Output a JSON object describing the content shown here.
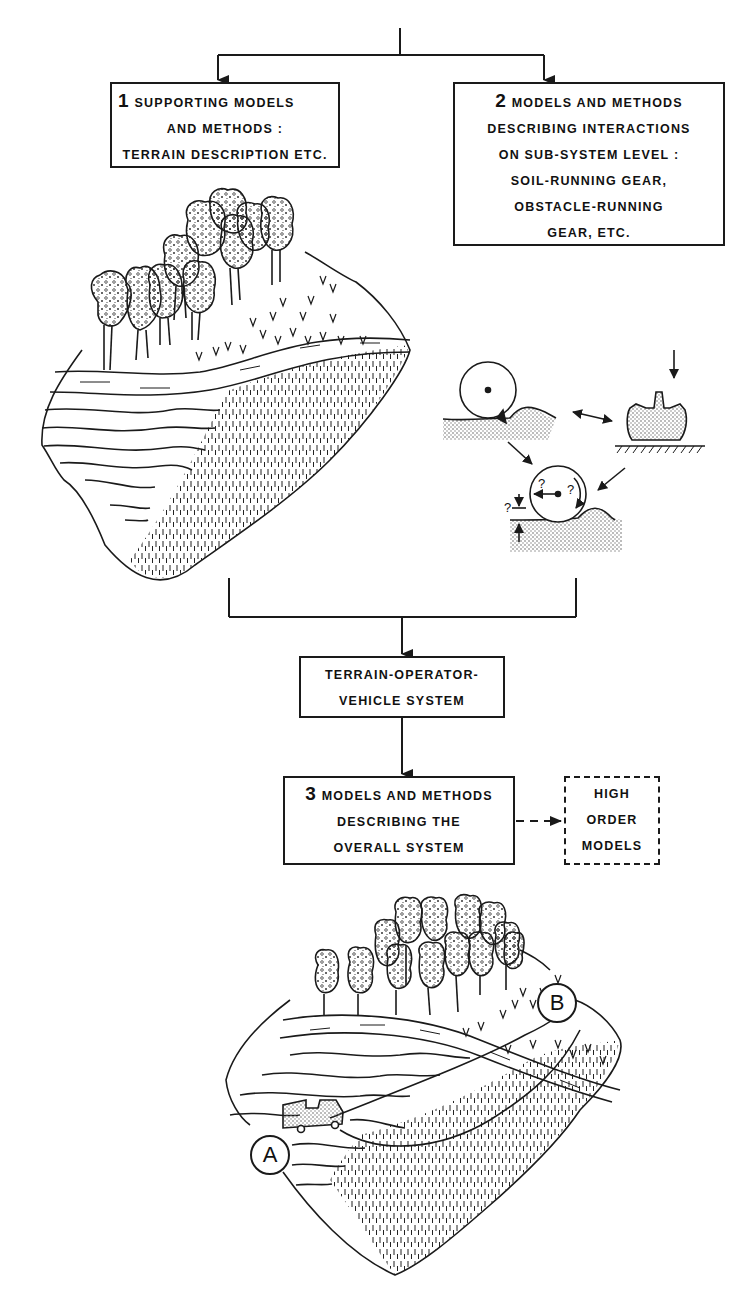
{
  "diagram": {
    "type": "flowchart",
    "boxes": {
      "supporting": {
        "number": "1",
        "lines": [
          "SUPPORTING MODELS",
          "AND METHODS :",
          "TERRAIN DESCRIPTION ETC."
        ]
      },
      "subsystem": {
        "number": "2",
        "lines": [
          "MODELS AND METHODS",
          "DESCRIBING INTERACTIONS",
          "ON SUB-SYSTEM LEVEL :",
          "SOIL-RUNNING GEAR,",
          "OBSTACLE-RUNNING",
          "GEAR, ETC."
        ]
      },
      "system": {
        "lines": [
          "TERRAIN-OPERATOR-",
          "VEHICLE SYSTEM"
        ]
      },
      "overall": {
        "number": "3",
        "lines": [
          "MODELS AND METHODS",
          "DESCRIBING THE",
          "OVERALL SYSTEM"
        ]
      },
      "high_order": {
        "style": "dashed",
        "lines": [
          "HIGH",
          "ORDER",
          "MODELS"
        ]
      }
    },
    "illustrations": {
      "terrain_top": "terrain-block-with-trees-grass-and-soil-layers",
      "wheel_interactions": {
        "question_marks": [
          "?",
          "?",
          "?"
        ]
      },
      "terrain_bottom": {
        "markers": [
          "A",
          "B"
        ],
        "vehicle": "truck-icon"
      }
    },
    "edges": [
      {
        "from": "top",
        "to": "supporting",
        "style": "solid"
      },
      {
        "from": "top",
        "to": "subsystem",
        "style": "solid"
      },
      {
        "from": "supporting",
        "to": "system",
        "style": "solid"
      },
      {
        "from": "subsystem",
        "to": "system",
        "style": "solid"
      },
      {
        "from": "system",
        "to": "overall",
        "style": "solid"
      },
      {
        "from": "overall",
        "to": "high_order",
        "style": "dashed"
      }
    ]
  }
}
